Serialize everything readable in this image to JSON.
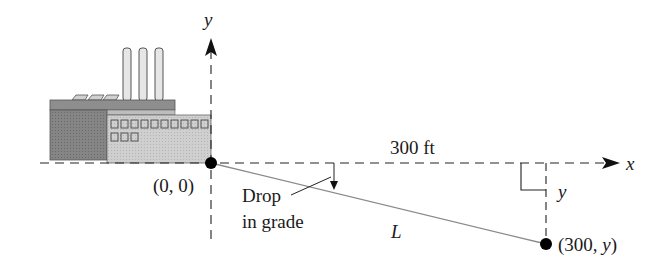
{
  "diagram": {
    "type": "coordinate-sketch",
    "labels": {
      "y_axis": "y",
      "x_axis": "x",
      "origin": "(0, 0)",
      "distance": "300 ft",
      "drop_line1": "Drop",
      "drop_line2": "in grade",
      "pipe": "L",
      "vertical_drop": "y",
      "end_point_open": "(300, ",
      "end_point_var": "y",
      "end_point_close": ")"
    },
    "points": [
      {
        "name": "origin",
        "coords": "(0, 0)"
      },
      {
        "name": "end",
        "coords": "(300, y)"
      }
    ],
    "colors": {
      "line": "#1a1a1a",
      "pipe": "#8a8a8a",
      "factory_dark": "#7d7d7d",
      "factory_light": "#c8c8c8",
      "factory_roof": "#9a9a9a"
    }
  }
}
